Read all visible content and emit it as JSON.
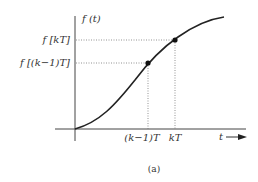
{
  "diagram": {
    "y_axis_label": "f (t)",
    "x_axis_label": "t",
    "y_ticks": [
      {
        "label": "f [kT]",
        "y": 40
      },
      {
        "label": "f [(k−1)T]",
        "y": 63
      }
    ],
    "x_ticks": [
      {
        "label": "(k−1)T",
        "x": 148
      },
      {
        "label": "kT",
        "x": 175
      }
    ],
    "points": [
      {
        "name": "sample-k-minus-1",
        "x": 148,
        "y": 63
      },
      {
        "name": "sample-k",
        "x": 175,
        "y": 40
      }
    ],
    "caption": "(a)",
    "colors": {
      "curve": "#222222",
      "axis": "#444444",
      "guide": "#777777"
    }
  }
}
